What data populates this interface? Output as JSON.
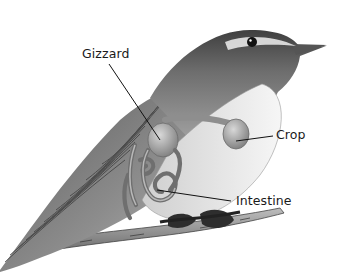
{
  "figure": {
    "style": "grayscale pencil illustration of a songbird perched on a branch",
    "colors": {
      "background": "#ffffff",
      "label_text": "#1a1a1a",
      "leader_line": "#111111",
      "plumage_dark": "#4a4a4a",
      "plumage_mid": "#8a8a8a",
      "breast_light": "#e8e8e8",
      "organs": "#9c9c9c"
    },
    "labels": [
      {
        "id": "gizzard",
        "text": "Gizzard",
        "points_to": "gizzard organ"
      },
      {
        "id": "crop",
        "text": "Crop",
        "points_to": "crop organ"
      },
      {
        "id": "intestine",
        "text": "Intestine",
        "points_to": "coiled intestine"
      }
    ]
  }
}
